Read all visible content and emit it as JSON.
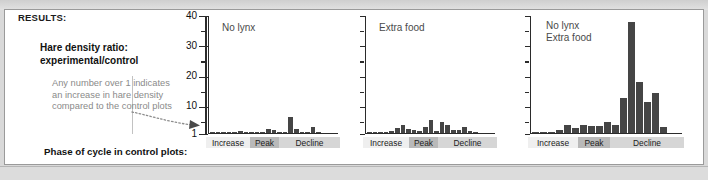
{
  "header": {
    "results_label": "RESULTS:"
  },
  "caption": {
    "ratio_title_line1": "Hare density ratio:",
    "ratio_title_line2": "experimental/control",
    "note": "Any number over 1 indicates an increase in hare density compared to the control plots",
    "phase_label": "Phase of cycle in control plots:"
  },
  "axis": {
    "ticks": [
      "40",
      "30",
      "20",
      "10",
      "1"
    ],
    "baseline_value": "1"
  },
  "phases": {
    "increase": "Increase",
    "peak": "Peak",
    "decline": "Decline"
  },
  "colors": {
    "bar": "#454545",
    "axis": "#2b2b2b",
    "note_text": "#8a8a8a",
    "panel_title": "#4a4a4a",
    "seg_increase": "#efefef",
    "seg_peak": "#b9b9b9",
    "seg_decline": "#d6d6d6"
  },
  "chart_data": [
    {
      "type": "bar",
      "title": "No lynx",
      "ylabel": "Hare density ratio: experimental/control",
      "xlabel": "Phase of cycle in control plots",
      "ylim": [
        1,
        40
      ],
      "yticks": [
        1,
        10,
        20,
        30,
        40
      ],
      "grid": false,
      "baseline": 1,
      "values": [
        1.0,
        1.0,
        1.05,
        1.0,
        1.0,
        1.5,
        1.0,
        1.0,
        1.1,
        1.0,
        2.2,
        1.9,
        1.2,
        1.0,
        6.3,
        2.2,
        1.2,
        1.0,
        2.8,
        1.0
      ],
      "phase_spans": {
        "increase": [
          0,
          5
        ],
        "peak": [
          5,
          8
        ],
        "decline": [
          8,
          20
        ]
      }
    },
    {
      "type": "bar",
      "title": "Extra food",
      "ylabel": "Hare density ratio: experimental/control",
      "xlabel": "Phase of cycle in control plots",
      "ylim": [
        1,
        40
      ],
      "yticks": [
        1,
        10,
        20,
        30,
        40
      ],
      "grid": false,
      "baseline": 1,
      "values": [
        1.0,
        1.0,
        1.0,
        1.2,
        1.5,
        2.6,
        3.4,
        2.3,
        2.0,
        1.5,
        3.0,
        5.2,
        1.6,
        4.6,
        3.6,
        1.8,
        2.0,
        3.0,
        1.5,
        1.2
      ],
      "phase_spans": {
        "increase": [
          0,
          5
        ],
        "peak": [
          5,
          8
        ],
        "decline": [
          8,
          20
        ]
      }
    },
    {
      "type": "bar",
      "title": "No lynx\nExtra food",
      "ylabel": "Hare density ratio: experimental/control",
      "xlabel": "Phase of cycle in control plots",
      "ylim": [
        1,
        40
      ],
      "yticks": [
        1,
        10,
        20,
        30,
        40
      ],
      "grid": false,
      "baseline": 1,
      "values": [
        1.0,
        1.0,
        1.0,
        1.8,
        3.6,
        2.6,
        3.4,
        3.2,
        3.3,
        4.6,
        3.4,
        12.5,
        37.5,
        17.8,
        11.0,
        14.0,
        2.8
      ],
      "phase_spans": {
        "increase": [
          0,
          4
        ],
        "peak": [
          4,
          7
        ],
        "decline": [
          7,
          17
        ]
      }
    }
  ],
  "panel_layout": [
    {
      "left": 208,
      "width": 130,
      "title_x": 222,
      "title_y": 22,
      "strip_left": 206,
      "strip_width": 134,
      "seg_w": [
        44,
        29,
        61
      ]
    },
    {
      "left": 365,
      "width": 130,
      "title_x": 379,
      "title_y": 22,
      "strip_left": 363,
      "strip_width": 134,
      "seg_w": [
        46,
        29,
        59
      ]
    },
    {
      "left": 530,
      "width": 152,
      "title_x": 546,
      "title_y": 20,
      "strip_left": 528,
      "strip_width": 156,
      "seg_w": [
        50,
        32,
        74
      ]
    }
  ]
}
